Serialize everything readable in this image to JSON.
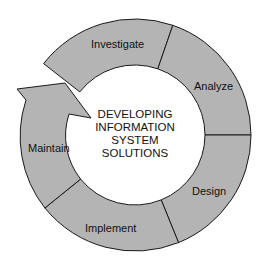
{
  "diagram": {
    "title_lines": [
      "DEVELOPING",
      "INFORMATION",
      "SYSTEM",
      "SOLUTIONS"
    ],
    "stages": [
      {
        "label": "Investigate"
      },
      {
        "label": "Analyze"
      },
      {
        "label": "Design"
      },
      {
        "label": "Implement"
      },
      {
        "label": "Maintain"
      }
    ],
    "fill_color": "#b4b4b4",
    "stroke_color": "#1a1a1a",
    "flow_direction": "clockwise"
  }
}
